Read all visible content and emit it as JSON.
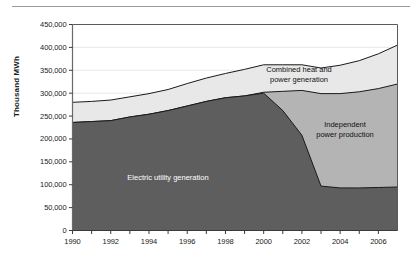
{
  "chart_data": {
    "type": "area",
    "stacked": true,
    "title": "",
    "subtitle": "",
    "xlabel": "",
    "ylabel": "Thousand MWh",
    "x": [
      1990,
      1991,
      1992,
      1993,
      1994,
      1995,
      1996,
      1997,
      1998,
      1999,
      2000,
      2001,
      2002,
      2003,
      2004,
      2005,
      2006,
      2007
    ],
    "xtick_labels": [
      "1990",
      "1992",
      "1994",
      "1996",
      "1998",
      "2000",
      "2002",
      "2004",
      "2006"
    ],
    "xticks": [
      1990,
      1992,
      1994,
      1996,
      1998,
      2000,
      2002,
      2004,
      2006
    ],
    "xlim": [
      1990,
      2007
    ],
    "ylim": [
      0,
      450000
    ],
    "yticks": [
      0,
      50000,
      100000,
      150000,
      200000,
      250000,
      300000,
      350000,
      400000,
      450000
    ],
    "ytick_labels": [
      "0",
      "50,000",
      "100,000",
      "150,000",
      "200,000",
      "250,000",
      "300,000",
      "350,000",
      "400,000",
      "450,000"
    ],
    "grid": true,
    "grid_axis": "y",
    "legend": "inline-annotations",
    "series": [
      {
        "name": "Electric utility generation",
        "color": "#5e5e5e",
        "label_color": "#ffffff",
        "values": [
          236000,
          238000,
          240000,
          248000,
          254000,
          262000,
          272000,
          282000,
          290000,
          294000,
          300000,
          262000,
          208000,
          97000,
          93000,
          93000,
          94000,
          95000
        ]
      },
      {
        "name": "Independent power production",
        "color": "#b4b4b4",
        "label_color": "#111111",
        "values": [
          0,
          0,
          0,
          0,
          0,
          0,
          0,
          0,
          0,
          0,
          2000,
          42000,
          98000,
          202000,
          206000,
          210000,
          216000,
          225000
        ]
      },
      {
        "name": "Combined heat and power generation",
        "color": "#e8e8e8",
        "label_color": "#111111",
        "values": [
          44000,
          44000,
          45000,
          44000,
          45000,
          46000,
          49000,
          51000,
          53000,
          58000,
          60000,
          58000,
          56000,
          56000,
          62000,
          68000,
          76000,
          85000
        ]
      }
    ],
    "totals": [
      280000,
      282000,
      285000,
      292000,
      299000,
      308000,
      321000,
      333000,
      343000,
      352000,
      362000,
      362000,
      362000,
      355000,
      361000,
      371000,
      386000,
      405000
    ],
    "annotations": [
      {
        "text": "Electric utility generation",
        "lines": [
          "Electric utility generation"
        ]
      },
      {
        "text": "Combined heat and power generation",
        "lines": [
          "Combined heat and",
          "power generation"
        ]
      },
      {
        "text": "Independent power production",
        "lines": [
          "Independent",
          "power production"
        ]
      }
    ]
  },
  "annotation_text": {
    "electric_line1": "Electric utility generation",
    "combined_line1": "Combined heat and",
    "combined_line2": "power generation",
    "independent_line1": "Independent",
    "independent_line2": "power production"
  }
}
